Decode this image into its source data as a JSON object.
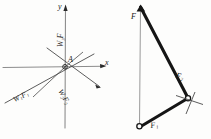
{
  "figure": {
    "ink_color": "#2b2b2b",
    "thin_color": "#6b6b6b",
    "paper_color": "#fdfdfc"
  },
  "left_diagram": {
    "name": "force-system-at-point-A",
    "origin_label": "A",
    "axis_x_label": "x",
    "axis_y_label": "y",
    "vectors": [
      {
        "id": "wf3",
        "label_main": "W",
        "label_sub": "3",
        "label_tail": "F",
        "text": "W₃F"
      },
      {
        "id": "w1f1",
        "label_main": "W",
        "label_sub": "1",
        "label_tail": "F",
        "text": "W₁F₁"
      },
      {
        "id": "w2f2",
        "label_main": "W",
        "label_sub": "2",
        "label_tail": "F",
        "text": "W₂F₂"
      }
    ]
  },
  "right_diagram": {
    "name": "force-polygon",
    "labels": [
      {
        "id": "F",
        "text": "F"
      },
      {
        "id": "F2",
        "text": "F₂"
      },
      {
        "id": "F1",
        "text": "F₁"
      }
    ],
    "vertex_count": 3
  }
}
